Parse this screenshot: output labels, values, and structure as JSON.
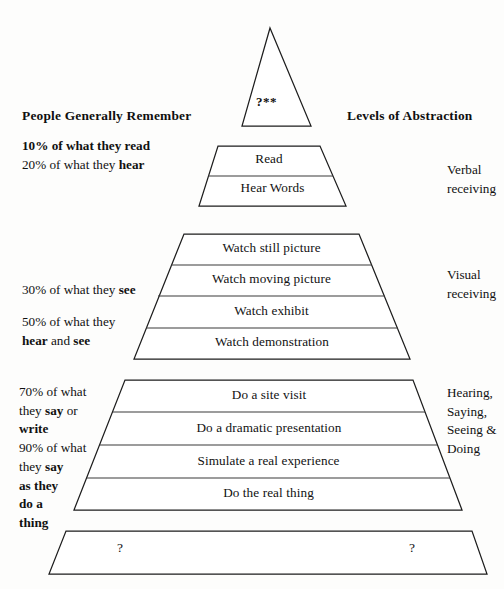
{
  "headings": {
    "left": "People Generally Remember",
    "right": "Levels of Abstraction"
  },
  "apex": {
    "label": "?**"
  },
  "tiers": [
    {
      "id": "tier-read",
      "label": "Read"
    },
    {
      "id": "tier-hear-words",
      "label": "Hear Words"
    },
    {
      "id": "tier-watch-still-picture",
      "label": "Watch still picture"
    },
    {
      "id": "tier-watch-moving-picture",
      "label": "Watch moving picture"
    },
    {
      "id": "tier-watch-exhibit",
      "label": "Watch exhibit"
    },
    {
      "id": "tier-watch-demonstration",
      "label": "Watch demonstration"
    },
    {
      "id": "tier-do-site-visit",
      "label": "Do a site visit"
    },
    {
      "id": "tier-dramatic-presentation",
      "label": "Do a dramatic presentation"
    },
    {
      "id": "tier-simulate-experience",
      "label": "Simulate a real experience"
    },
    {
      "id": "tier-do-real-thing",
      "label": "Do the real thing"
    }
  ],
  "bottom_band": {
    "question_left": "?",
    "question_right": "?"
  },
  "left_notes": [
    {
      "id": "note-10-20",
      "lines": [
        [
          {
            "t": "10% of what they read",
            "b": true
          }
        ],
        [
          {
            "t": "20% of what they ",
            "b": false
          },
          {
            "t": "hear",
            "b": true
          }
        ]
      ]
    },
    {
      "id": "note-30",
      "lines": [
        [
          {
            "t": "30% of what they ",
            "b": false
          },
          {
            "t": "see",
            "b": true
          }
        ]
      ]
    },
    {
      "id": "note-50",
      "lines": [
        [
          {
            "t": "50% of what they",
            "b": false
          }
        ],
        [
          {
            "t": "hear",
            "b": true
          },
          {
            "t": " and ",
            "b": false
          },
          {
            "t": "see",
            "b": true
          }
        ]
      ]
    },
    {
      "id": "note-70-90",
      "lines": [
        [
          {
            "t": "70% of what",
            "b": false
          }
        ],
        [
          {
            "t": "they ",
            "b": false
          },
          {
            "t": "say",
            "b": true
          },
          {
            "t": " or",
            "b": false
          }
        ],
        [
          {
            "t": "write",
            "b": true
          }
        ],
        [
          {
            "t": "90% of what",
            "b": false
          }
        ],
        [
          {
            "t": "they ",
            "b": false
          },
          {
            "t": "say",
            "b": true
          }
        ],
        [
          {
            "t": "as they",
            "b": true
          }
        ],
        [
          {
            "t": "do a",
            "b": true
          }
        ],
        [
          {
            "t": "thing",
            "b": true
          }
        ]
      ]
    }
  ],
  "right_notes": [
    {
      "id": "right-note-verbal",
      "lines": [
        "Verbal",
        "receiving"
      ]
    },
    {
      "id": "right-note-visual",
      "lines": [
        "Visual",
        "receiving"
      ]
    },
    {
      "id": "right-note-doing",
      "lines": [
        "Hearing,",
        "Saying,",
        "Seeing &",
        "Doing"
      ]
    }
  ],
  "colors": {
    "ink": "#111111",
    "stroke": "#1d1d1d",
    "paper": "#fdfdfc"
  }
}
